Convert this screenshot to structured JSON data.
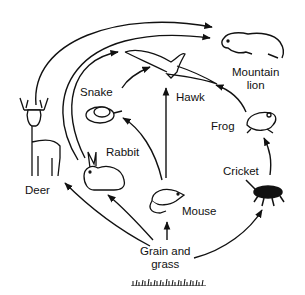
{
  "diagram": {
    "type": "food-web",
    "organisms": [
      {
        "id": "grain",
        "label_line1": "Grain and",
        "label_line2": "grass",
        "icon": "grass-icon"
      },
      {
        "id": "deer",
        "label": "Deer",
        "icon": "deer-icon"
      },
      {
        "id": "rabbit",
        "label": "Rabbit",
        "icon": "rabbit-icon"
      },
      {
        "id": "mouse",
        "label": "Mouse",
        "icon": "mouse-icon"
      },
      {
        "id": "cricket",
        "label": "Cricket",
        "icon": "cricket-icon"
      },
      {
        "id": "snake",
        "label": "Snake",
        "icon": "snake-icon"
      },
      {
        "id": "frog",
        "label": "Frog",
        "icon": "frog-icon"
      },
      {
        "id": "hawk",
        "label": "Hawk",
        "icon": "hawk-icon"
      },
      {
        "id": "lion",
        "label_line1": "Mountain",
        "label_line2": "lion",
        "icon": "mountain-lion-icon"
      }
    ],
    "edges": [
      {
        "from": "Grain and grass",
        "to": "Deer"
      },
      {
        "from": "Grain and grass",
        "to": "Rabbit"
      },
      {
        "from": "Grain and grass",
        "to": "Mouse"
      },
      {
        "from": "Grain and grass",
        "to": "Cricket"
      },
      {
        "from": "Deer",
        "to": "Mountain lion"
      },
      {
        "from": "Rabbit",
        "to": "Mountain lion"
      },
      {
        "from": "Rabbit",
        "to": "Hawk"
      },
      {
        "from": "Mouse",
        "to": "Snake"
      },
      {
        "from": "Mouse",
        "to": "Hawk"
      },
      {
        "from": "Snake",
        "to": "Hawk"
      },
      {
        "from": "Cricket",
        "to": "Frog"
      },
      {
        "from": "Frog",
        "to": "Hawk"
      }
    ],
    "arrow_color": "#111111"
  }
}
